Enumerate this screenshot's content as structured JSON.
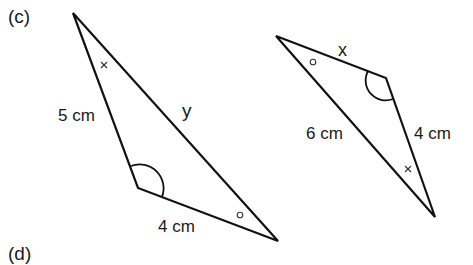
{
  "part_label": "(c)",
  "next_part_label": "(d)",
  "triangle_left": {
    "side_left": "5 cm",
    "side_hypotenuse": "y",
    "side_bottom": "4 cm",
    "marks": {
      "top_angle": "×",
      "right_angle": "o",
      "bottom_left_angle": "arc"
    }
  },
  "triangle_right": {
    "side_top": "x",
    "side_left": "6 cm",
    "side_right": "4 cm",
    "marks": {
      "left_angle": "o",
      "bottom_angle": "×",
      "top_right_angle": "arc"
    }
  },
  "colors": {
    "stroke": "#111111",
    "background": "#ffffff"
  }
}
